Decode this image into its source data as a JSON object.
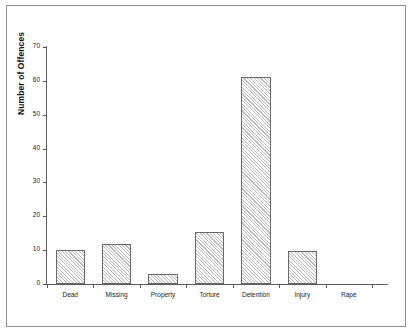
{
  "chart_data": {
    "type": "bar",
    "title": "",
    "xlabel": "",
    "ylabel": "Number of Offences",
    "categories": [
      "Dead",
      "Missing",
      "Property",
      "Torture",
      "Detention",
      "Injury",
      "Rape"
    ],
    "values": [
      10,
      11.7,
      3,
      15.5,
      61,
      9.7,
      0
    ],
    "ylim": [
      0,
      70
    ],
    "ytick_labels": [
      "0",
      "10",
      "20",
      "30",
      "40",
      "50",
      "60",
      "70"
    ],
    "ytick_values": [
      0,
      10,
      20,
      30,
      40,
      50,
      60,
      70
    ],
    "grid": false,
    "legend": false,
    "bar_style": {
      "fill": "#ffffff",
      "hatch": "diagonal-45",
      "hatch_color": "#b9b9b9",
      "edge_color": "#6a6a6a"
    },
    "background": "#ffffff",
    "frame_color": "#8d8d8d",
    "axis_color": "#5a5a5a"
  }
}
